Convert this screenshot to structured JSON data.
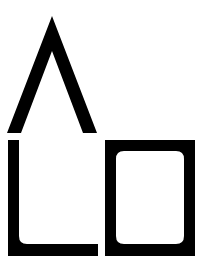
{
  "logo": {
    "description": "Black geometric logo mark: chevron roof above an L-shape and a rounded square outline",
    "colors": {
      "foreground": "#000000",
      "background": "#ffffff"
    },
    "shapes": {
      "chevron": {
        "apex": [
          52,
          16
        ],
        "left_base": [
          8,
          133
        ],
        "right_base": [
          97,
          133
        ],
        "stroke": 13
      },
      "l_shape": {
        "x": 8,
        "y": 140,
        "width": 90,
        "height": 116,
        "stroke": 11
      },
      "box": {
        "x": 105,
        "y": 140,
        "width": 90,
        "height": 116,
        "stroke": 11,
        "inner_radius": 8
      }
    }
  }
}
